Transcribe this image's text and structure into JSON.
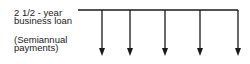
{
  "diagram": {
    "type": "cash-flow-timeline",
    "title_lines": [
      "2 1/2 - year",
      "business loan"
    ],
    "note_lines": [
      "(Semiannual",
      "payments)"
    ],
    "timeline": {
      "y": 10,
      "x_start": 78,
      "x_end": 238,
      "line_color": "#1a1a1a"
    },
    "arrows": [
      {
        "x": 102,
        "direction": "down"
      },
      {
        "x": 130,
        "direction": "down"
      },
      {
        "x": 165,
        "direction": "down"
      },
      {
        "x": 200,
        "direction": "down"
      },
      {
        "x": 238,
        "direction": "down"
      }
    ],
    "arrow_count": 5
  }
}
